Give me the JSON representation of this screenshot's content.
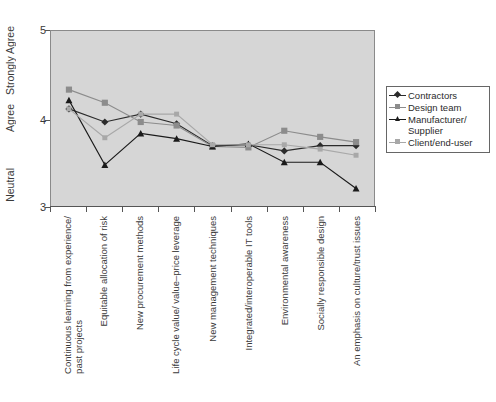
{
  "chart_data": {
    "type": "line",
    "title": "",
    "xlabel": "",
    "ylabel": "",
    "ylim": [
      3,
      5
    ],
    "grid": false,
    "legend_position": "right",
    "y_ticks": [
      {
        "value": "3",
        "label": "Neutral"
      },
      {
        "value": "4",
        "label": "Agree"
      },
      {
        "value": "5",
        "label": "Strongly Agree"
      }
    ],
    "categories": [
      "Continuous learning from experience/ past projects",
      "Equitable allocation of risk",
      "New procurement methods",
      "Life cycle value/ value–price leverage",
      "New management techniques",
      "Integrated/interoperable IT tools",
      "Environmental awareness",
      "Socially responsible design",
      "An emphasis on culture/trust issues"
    ],
    "category_lines": [
      [
        "Continuous learning from experience/",
        "past projects"
      ],
      [
        "Equitable allocation of risk",
        ""
      ],
      [
        "New procurement methods",
        ""
      ],
      [
        "Life cycle value/ value–price leverage",
        ""
      ],
      [
        "New management techniques",
        ""
      ],
      [
        "Integrated/interoperable IT tools",
        ""
      ],
      [
        "Environmental awareness",
        ""
      ],
      [
        "Socially responsible design",
        ""
      ],
      [
        "An emphasis on culture/trust issues",
        ""
      ]
    ],
    "series": [
      {
        "name": "Contractors",
        "marker": "diamond",
        "color": "#2b2b2b",
        "values": [
          4.11,
          3.96,
          4.05,
          3.94,
          3.69,
          3.7,
          3.63,
          3.69,
          3.69
        ]
      },
      {
        "name": "Design team",
        "marker": "square",
        "color": "#8c8c8c",
        "values": [
          4.33,
          4.18,
          3.96,
          3.92,
          3.68,
          3.67,
          3.86,
          3.79,
          3.73
        ]
      },
      {
        "name": "Manufacturer/ Supplier",
        "name_lines": [
          "Manufacturer/",
          "Supplier"
        ],
        "marker": "triangle",
        "color": "#1a1a1a",
        "values": [
          4.21,
          3.47,
          3.83,
          3.77,
          3.68,
          3.71,
          3.5,
          3.5,
          3.2
        ]
      },
      {
        "name": "Client/end-user",
        "marker": "cross",
        "color": "#a8a8a8",
        "values": [
          4.11,
          3.78,
          4.05,
          4.05,
          3.7,
          3.7,
          3.7,
          3.65,
          3.58
        ]
      }
    ]
  },
  "legend": {
    "items": [
      {
        "label": "Contractors"
      },
      {
        "label": "Design team"
      },
      {
        "label": "Manufacturer/",
        "label2": "Supplier"
      },
      {
        "label": "Client/end-user"
      }
    ]
  }
}
